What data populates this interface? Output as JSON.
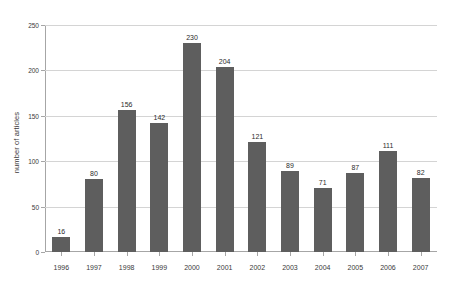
{
  "chart_data": {
    "type": "bar",
    "title": "",
    "subtitle": "",
    "xlabel": "",
    "ylabel": "number of articles",
    "categories": [
      "1996",
      "1997",
      "1998",
      "1999",
      "2000",
      "2001",
      "2002",
      "2003",
      "2004",
      "2005",
      "2006",
      "2007"
    ],
    "values": [
      16,
      80,
      156,
      142,
      230,
      204,
      121,
      89,
      71,
      87,
      111,
      82
    ],
    "data_labels": [
      "16",
      "80",
      "156",
      "142",
      "230",
      "204",
      "121",
      "89",
      "71",
      "87",
      "111",
      "82"
    ],
    "ylim": [
      0,
      250
    ],
    "yticks": [
      0,
      50,
      100,
      150,
      200,
      250
    ],
    "ytick_labels": [
      "0",
      "50",
      "100",
      "150",
      "200",
      "250"
    ],
    "grid": true,
    "grid_axis": "y",
    "legend": false,
    "legend_position": "none",
    "bar_color": "#5e5e5e",
    "background_color": "#ffffff",
    "axis_color": "#a6a6a6",
    "gridline_color": "#d4d4d4",
    "text_color": "#3a3a3a"
  }
}
